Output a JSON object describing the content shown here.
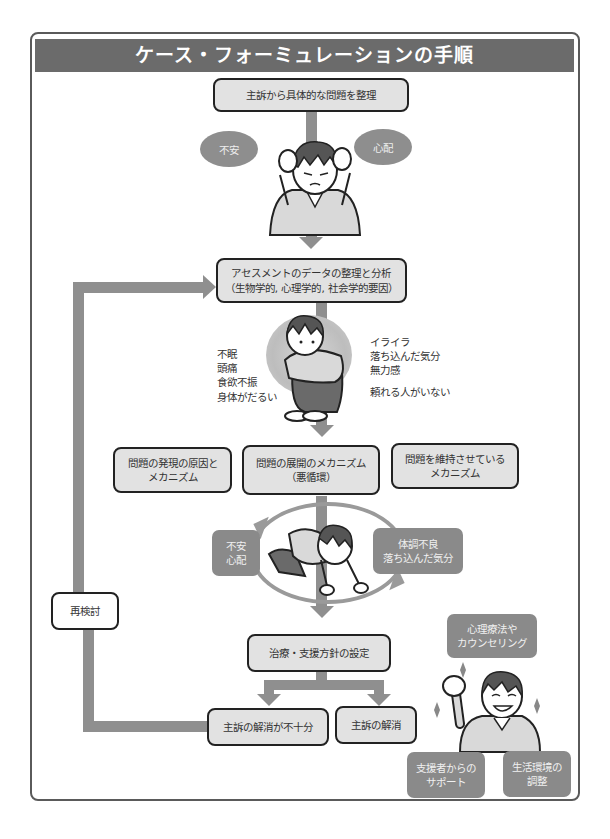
{
  "title": "ケース・フォーミュレーションの手順",
  "steps": {
    "organize_problem": "主訴から具体的な問題を整理",
    "assessment": "アセスメントのデータの整理と分析\n（生物学的, 心理学的, 社会学的要因）",
    "mechanism_onset": "問題の発現の原因と\nメカニズム",
    "mechanism_development": "問題の展開のメカニズム\n（悪循環）",
    "mechanism_maintenance": "問題を維持させている\nメカニズム",
    "treatment_plan": "治療・支援方針の設定",
    "insufficient_resolution": "主訴の解消が不十分",
    "resolution": "主訴の解消",
    "reexamine": "再検討"
  },
  "clouds": {
    "left": "不安",
    "right": "心配"
  },
  "assessment_symptoms": {
    "physical": "不眠\n頭痛\n食欲不振\n身体がだるい",
    "psychological": "イライラ\n落ち込んだ気分\n無力感",
    "social": "頼れる人がいない"
  },
  "vicious_cycle": {
    "left": "不安\n心配",
    "right": "体調不良\n落ち込んだ気分"
  },
  "support": {
    "therapy": "心理療法や\nカウンセリング",
    "supporter": "支援者からの\nサポート",
    "environment": "生活環境の\n調整"
  },
  "colors": {
    "title_bar": "#6b6b6b",
    "box_fill": "#e2e2e2",
    "arrow": "#8f8f8f",
    "gray_box": "#8a8a8a",
    "frame_border": "#5a5a5a"
  }
}
